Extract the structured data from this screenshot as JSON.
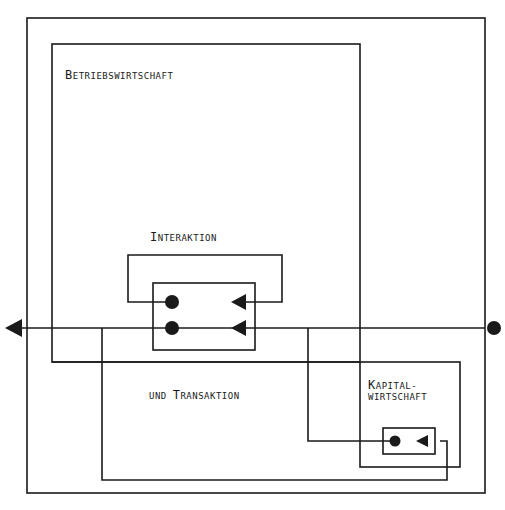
{
  "diagram": {
    "labels": {
      "betriebswirtschaft": {
        "first": "B",
        "rest": "ETRIEBSWIRTSCHAFT"
      },
      "interaktion": {
        "first": "I",
        "rest": "NTERAKTION"
      },
      "transaktion": {
        "pre": "UND ",
        "first": "T",
        "rest": "RANSAKTION"
      },
      "kapital_line1": {
        "first": "K",
        "rest": "APITAL-"
      },
      "kapital_line2": "WIRTSCHAFT"
    },
    "colors": {
      "line": "#1a1a1a",
      "background": "#ffffff"
    }
  }
}
